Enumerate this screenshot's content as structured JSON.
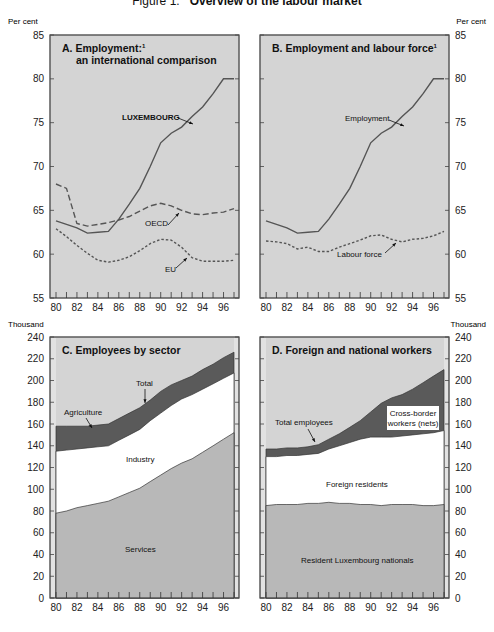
{
  "figure": {
    "title_prefix": "Figure 1.",
    "title": "Overview of the labour market"
  },
  "axis_units": {
    "top_left": "Per cent",
    "top_right": "Per cent",
    "bottom_left": "Thousand",
    "bottom_right": "Thousand"
  },
  "colors": {
    "panel_bg": "#d4d4d4",
    "dark_band": "#5a5a5a",
    "white_band": "#ffffff",
    "services_fill": "#b8b8b8",
    "line": "#555555"
  },
  "chart_data": [
    {
      "type": "line",
      "title": "A. Employment: an international comparison",
      "footnote_marker": "1",
      "xlabel": "",
      "ylabel": "Per cent",
      "x": [
        80,
        81,
        82,
        83,
        84,
        85,
        86,
        87,
        88,
        89,
        90,
        91,
        92,
        93,
        94,
        95,
        96,
        97
      ],
      "x_ticks": [
        "80",
        "82",
        "84",
        "86",
        "88",
        "90",
        "92",
        "94",
        "96"
      ],
      "ylim": [
        55,
        85
      ],
      "y_ticks": [
        55,
        60,
        65,
        70,
        75,
        80,
        85
      ],
      "series": [
        {
          "name": "LUXEMBOURG",
          "style": "solid",
          "values": [
            63.8,
            63.4,
            63.0,
            62.4,
            62.5,
            62.6,
            64.0,
            65.7,
            67.5,
            70.0,
            72.7,
            73.8,
            74.5,
            75.7,
            76.8,
            78.3,
            80.0,
            80.0
          ]
        },
        {
          "name": "OECD",
          "style": "dashed",
          "values": [
            68.0,
            67.5,
            63.5,
            63.2,
            63.4,
            63.6,
            63.9,
            64.3,
            64.9,
            65.5,
            65.8,
            65.5,
            65.0,
            64.6,
            64.5,
            64.7,
            64.8,
            65.2
          ]
        },
        {
          "name": "EU",
          "style": "dotted",
          "values": [
            62.9,
            62.0,
            61.0,
            60.1,
            59.3,
            59.1,
            59.3,
            59.7,
            60.4,
            61.2,
            61.7,
            61.6,
            60.8,
            59.6,
            59.2,
            59.2,
            59.2,
            59.3
          ]
        }
      ],
      "annotations": [
        "LUXEMBOURG",
        "OECD",
        "EU"
      ]
    },
    {
      "type": "line",
      "title": "B. Employment and labour force",
      "footnote_marker": "1",
      "xlabel": "",
      "ylabel": "Per cent",
      "x": [
        80,
        81,
        82,
        83,
        84,
        85,
        86,
        87,
        88,
        89,
        90,
        91,
        92,
        93,
        94,
        95,
        96,
        97
      ],
      "x_ticks": [
        "80",
        "82",
        "84",
        "86",
        "88",
        "90",
        "92",
        "94",
        "96"
      ],
      "ylim": [
        55,
        85
      ],
      "y_ticks": [
        55,
        60,
        65,
        70,
        75,
        80,
        85
      ],
      "series": [
        {
          "name": "Employment",
          "style": "solid",
          "values": [
            63.8,
            63.4,
            63.0,
            62.4,
            62.5,
            62.6,
            64.0,
            65.7,
            67.5,
            70.0,
            72.7,
            73.8,
            74.5,
            75.7,
            76.8,
            78.3,
            80.0,
            80.0
          ]
        },
        {
          "name": "Labour force",
          "style": "dotted",
          "values": [
            61.5,
            61.4,
            61.2,
            60.6,
            60.8,
            60.3,
            60.3,
            60.8,
            61.2,
            61.6,
            62.1,
            62.2,
            61.7,
            61.4,
            61.7,
            61.8,
            62.1,
            62.6
          ]
        }
      ],
      "annotations": [
        "Employment",
        "Labour force"
      ]
    },
    {
      "type": "area",
      "title": "C. Employees by sector",
      "xlabel": "",
      "ylabel": "Thousand",
      "x": [
        80,
        81,
        82,
        83,
        84,
        85,
        86,
        87,
        88,
        89,
        90,
        91,
        92,
        93,
        94,
        95,
        96,
        97
      ],
      "x_ticks": [
        "80",
        "82",
        "84",
        "86",
        "88",
        "90",
        "92",
        "94",
        "96"
      ],
      "ylim": [
        0,
        240
      ],
      "y_ticks": [
        0,
        20,
        40,
        60,
        80,
        100,
        120,
        140,
        160,
        180,
        200,
        220,
        240
      ],
      "series": [
        {
          "name": "Services",
          "values": [
            78,
            80,
            83,
            85,
            87,
            89,
            93,
            97,
            101,
            107,
            113,
            119,
            124,
            128,
            134,
            140,
            146,
            152
          ]
        },
        {
          "name": "Industry (cumulative top)",
          "values": [
            135,
            136,
            137,
            138,
            139,
            140,
            145,
            150,
            155,
            163,
            170,
            177,
            183,
            187,
            192,
            197,
            202,
            207
          ]
        },
        {
          "name": "Total (incl. Agriculture)",
          "values": [
            158,
            158,
            158,
            158,
            159,
            160,
            165,
            170,
            175,
            182,
            190,
            196,
            200,
            204,
            210,
            215,
            221,
            226
          ]
        }
      ],
      "annotations": [
        "Total",
        "Agriculture",
        "Industry",
        "Services"
      ]
    },
    {
      "type": "area",
      "title": "D. Foreign and national workers",
      "xlabel": "",
      "ylabel": "Thousand",
      "x": [
        80,
        81,
        82,
        83,
        84,
        85,
        86,
        87,
        88,
        89,
        90,
        91,
        92,
        93,
        94,
        95,
        96,
        97
      ],
      "x_ticks": [
        "80",
        "82",
        "84",
        "86",
        "88",
        "90",
        "92",
        "94",
        "96"
      ],
      "ylim": [
        0,
        240
      ],
      "y_ticks": [
        0,
        20,
        40,
        60,
        80,
        100,
        120,
        140,
        160,
        180,
        200,
        220,
        240
      ],
      "series": [
        {
          "name": "Resident Luxembourg nationals",
          "values": [
            85,
            86,
            86,
            86,
            87,
            87,
            88,
            87,
            87,
            86,
            86,
            85,
            86,
            86,
            86,
            85,
            85,
            86
          ]
        },
        {
          "name": "Foreign residents (cumulative top)",
          "values": [
            130,
            130,
            131,
            131,
            132,
            133,
            137,
            140,
            143,
            146,
            148,
            148,
            148,
            149,
            150,
            151,
            152,
            154
          ]
        },
        {
          "name": "Total employees (incl. cross-border workers)",
          "values": [
            137,
            137,
            138,
            138,
            139,
            141,
            146,
            151,
            157,
            163,
            171,
            179,
            184,
            187,
            192,
            198,
            204,
            210
          ]
        }
      ],
      "annotations": [
        "Total employees",
        "Cross-border workers (nets)",
        "Foreign residents",
        "Resident Luxembourg nationals"
      ]
    }
  ]
}
